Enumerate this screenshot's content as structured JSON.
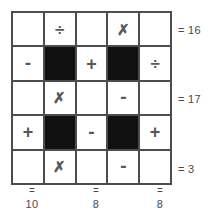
{
  "puzzle": {
    "type": "arithmetic-grid-puzzle",
    "rows": 5,
    "columns": 5,
    "operator_glyphs": {
      "times": "✗",
      "divide": "÷",
      "plus": "+",
      "minus": "-",
      "equals": "="
    },
    "grid": [
      [
        {
          "kind": "blank",
          "symbol": ""
        },
        {
          "kind": "operator",
          "symbol": "÷",
          "name": "divide"
        },
        {
          "kind": "blank",
          "symbol": ""
        },
        {
          "kind": "operator",
          "symbol": "✗",
          "name": "times"
        },
        {
          "kind": "blank",
          "symbol": ""
        }
      ],
      [
        {
          "kind": "operator",
          "symbol": "-",
          "name": "minus"
        },
        {
          "kind": "blocked",
          "symbol": ""
        },
        {
          "kind": "operator",
          "symbol": "+",
          "name": "plus"
        },
        {
          "kind": "blocked",
          "symbol": ""
        },
        {
          "kind": "operator",
          "symbol": "÷",
          "name": "divide"
        }
      ],
      [
        {
          "kind": "blank",
          "symbol": ""
        },
        {
          "kind": "operator",
          "symbol": "✗",
          "name": "times"
        },
        {
          "kind": "blank",
          "symbol": ""
        },
        {
          "kind": "operator",
          "symbol": "-",
          "name": "minus"
        },
        {
          "kind": "blank",
          "symbol": ""
        }
      ],
      [
        {
          "kind": "operator",
          "symbol": "+",
          "name": "plus"
        },
        {
          "kind": "blocked",
          "symbol": ""
        },
        {
          "kind": "operator",
          "symbol": "-",
          "name": "minus"
        },
        {
          "kind": "blocked",
          "symbol": ""
        },
        {
          "kind": "operator",
          "symbol": "+",
          "name": "plus"
        }
      ],
      [
        {
          "kind": "blank",
          "symbol": ""
        },
        {
          "kind": "operator",
          "symbol": "✗",
          "name": "times"
        },
        {
          "kind": "blank",
          "symbol": ""
        },
        {
          "kind": "operator",
          "symbol": "-",
          "name": "minus"
        },
        {
          "kind": "blank",
          "symbol": ""
        }
      ]
    ],
    "row_totals": [
      {
        "row": 0,
        "label": "= 16",
        "value": 16
      },
      {
        "row": 2,
        "label": "= 17",
        "value": 17
      },
      {
        "row": 4,
        "label": "= 3",
        "value": 3
      }
    ],
    "column_totals": [
      {
        "column": 0,
        "equals": "=",
        "value": "10"
      },
      {
        "column": 2,
        "equals": "=",
        "value": "8"
      },
      {
        "column": 4,
        "equals": "=",
        "value": "8"
      }
    ],
    "colors": {
      "grid_line": "#4d4d4d",
      "blocked_cell": "#111111",
      "cell_background": "#ffffff",
      "symbol": "#56575a",
      "total_text": "#4a4a4a"
    }
  }
}
